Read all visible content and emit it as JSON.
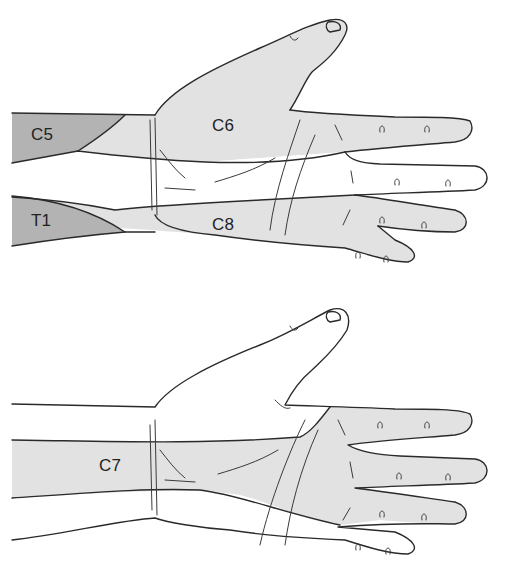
{
  "diagram": {
    "type": "dermatome-map",
    "colors": {
      "dark_region": "#b3b3b3",
      "light_region": "#e2e2e2",
      "unshaded": "#ffffff",
      "outline": "#2a2a2a"
    },
    "panels": [
      {
        "id": "top",
        "labels": [
          {
            "text": "C5",
            "shade": "dark"
          },
          {
            "text": "C6",
            "shade": "light"
          },
          {
            "text": "T1",
            "shade": "dark"
          },
          {
            "text": "C8",
            "shade": "light"
          }
        ]
      },
      {
        "id": "bottom",
        "labels": [
          {
            "text": "C7",
            "shade": "light"
          }
        ]
      }
    ]
  }
}
